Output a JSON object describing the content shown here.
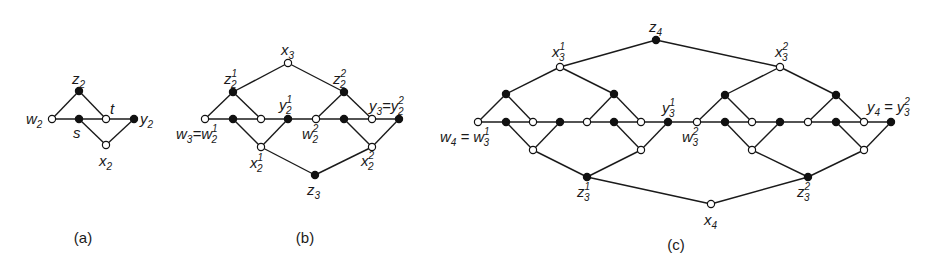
{
  "figure": {
    "panels": [
      {
        "id": "a",
        "caption": "(a)",
        "labels": {
          "z": {
            "base": "z",
            "sub": "2",
            "sup": ""
          },
          "w": {
            "base": "w",
            "sub": "2",
            "sup": ""
          },
          "s": {
            "base": "s",
            "sub": "",
            "sup": ""
          },
          "t": {
            "base": "t",
            "sub": "",
            "sup": ""
          },
          "y": {
            "base": "y",
            "sub": "2",
            "sup": ""
          },
          "x": {
            "base": "x",
            "sub": "2",
            "sup": ""
          }
        }
      },
      {
        "id": "b",
        "caption": "(b)",
        "labels": {
          "x3": {
            "base": "x",
            "sub": "3",
            "sup": ""
          },
          "z21": {
            "base": "z",
            "sub": "2",
            "sup": "1"
          },
          "z22": {
            "base": "z",
            "sub": "2",
            "sup": "2"
          },
          "y21": {
            "base": "y",
            "sub": "2",
            "sup": "1"
          },
          "w22": {
            "base": "w",
            "sub": "2",
            "sup": "2"
          },
          "w3_lhs": {
            "base": "w",
            "sub": "3",
            "sup": ""
          },
          "w3_rhs": {
            "base": "w",
            "sub": "2",
            "sup": "1"
          },
          "y3_lhs": {
            "base": "y",
            "sub": "3",
            "sup": ""
          },
          "y3_rhs": {
            "base": "y",
            "sub": "2",
            "sup": "2"
          },
          "x21": {
            "base": "x",
            "sub": "2",
            "sup": "1"
          },
          "x22": {
            "base": "x",
            "sub": "2",
            "sup": "2"
          },
          "z3": {
            "base": "z",
            "sub": "3",
            "sup": ""
          }
        },
        "equals": "="
      },
      {
        "id": "c",
        "caption": "(c)",
        "labels": {
          "z4": {
            "base": "z",
            "sub": "4",
            "sup": ""
          },
          "x31": {
            "base": "x",
            "sub": "3",
            "sup": "1"
          },
          "x32": {
            "base": "x",
            "sub": "3",
            "sup": "2"
          },
          "y31": {
            "base": "y",
            "sub": "3",
            "sup": "1"
          },
          "w32": {
            "base": "w",
            "sub": "3",
            "sup": "2"
          },
          "w4_lhs": {
            "base": "w",
            "sub": "4",
            "sup": ""
          },
          "w4_rhs": {
            "base": "w",
            "sub": "3",
            "sup": "1"
          },
          "y4_lhs": {
            "base": "y",
            "sub": "4",
            "sup": ""
          },
          "y4_rhs": {
            "base": "y",
            "sub": "3",
            "sup": "2"
          },
          "z31": {
            "base": "z",
            "sub": "3",
            "sup": "1"
          },
          "z32": {
            "base": "z",
            "sub": "3",
            "sup": "2"
          },
          "x4": {
            "base": "x",
            "sub": "4",
            "sup": ""
          }
        },
        "equals": "="
      }
    ],
    "node_colors": {
      "filled": "#111111",
      "hollow": "#ffffff"
    }
  }
}
